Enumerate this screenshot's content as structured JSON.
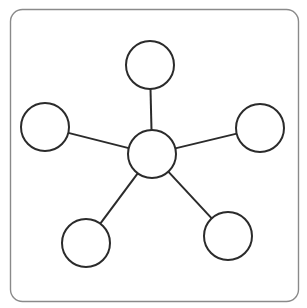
{
  "diagram": {
    "type": "hub-and-spoke",
    "colors": {
      "background": "#ffffff",
      "frame_stroke": "#8a8a8a",
      "node_stroke": "#2b2b2b",
      "node_fill": "#ffffff",
      "edge_stroke": "#2b2b2b"
    },
    "frame": {
      "x": 10.5,
      "y": 9.5,
      "width": 288,
      "height": 292,
      "radius": 12
    },
    "node_radius": 24,
    "center": {
      "id": "center",
      "cx": 152,
      "cy": 154
    },
    "spokes": [
      {
        "id": "top",
        "cx": 150,
        "cy": 65
      },
      {
        "id": "left",
        "cx": 45,
        "cy": 127
      },
      {
        "id": "right",
        "cx": 260,
        "cy": 128
      },
      {
        "id": "bottom-left",
        "cx": 86,
        "cy": 243
      },
      {
        "id": "bottom-right",
        "cx": 228,
        "cy": 236
      }
    ]
  }
}
